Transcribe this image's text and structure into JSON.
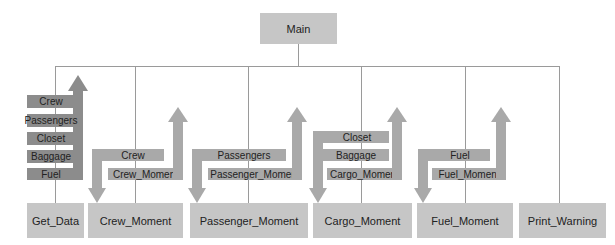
{
  "root": {
    "label": "Main"
  },
  "modules": [
    {
      "id": "get_data",
      "label": "Get_Data"
    },
    {
      "id": "crew_moment",
      "label": "Crew_Moment"
    },
    {
      "id": "passenger_moment",
      "label": "Passenger_Moment"
    },
    {
      "id": "cargo_moment",
      "label": "Cargo_Moment"
    },
    {
      "id": "fuel_moment",
      "label": "Fuel_Moment"
    },
    {
      "id": "print_warning",
      "label": "Print_Warning"
    }
  ],
  "flows": {
    "get_data_out": [
      "Crew",
      "Passengers",
      "Closet",
      "Baggage",
      "Fuel"
    ],
    "crew_in": [
      "Crew"
    ],
    "crew_out": [
      "Crew_Moment"
    ],
    "passenger_in": [
      "Passengers"
    ],
    "passenger_out": [
      "Passenger_Moment"
    ],
    "cargo_in": [
      "Closet",
      "Baggage"
    ],
    "cargo_out": [
      "Cargo_Moment"
    ],
    "fuel_in": [
      "Fuel"
    ],
    "fuel_out": [
      "Fuel_Moment"
    ]
  },
  "colors": {
    "box": "#c6c6c6",
    "line": "#9a9a9a",
    "arrow_dark": "#8c8c8c",
    "arrow_light": "#a9a9a9"
  }
}
